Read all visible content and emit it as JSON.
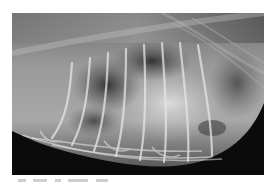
{
  "figure": {
    "kind": "radiograph",
    "view": "lateral thoracic radiograph",
    "colors": {
      "background_film": "#0a0a0a",
      "soft_tissue": "#8a8a8a",
      "bright_tissue": "#d8d8d8",
      "lung_dark": "#3a3a3a",
      "page_background": "#ffffff"
    }
  },
  "caption": {
    "visible_text": ""
  }
}
